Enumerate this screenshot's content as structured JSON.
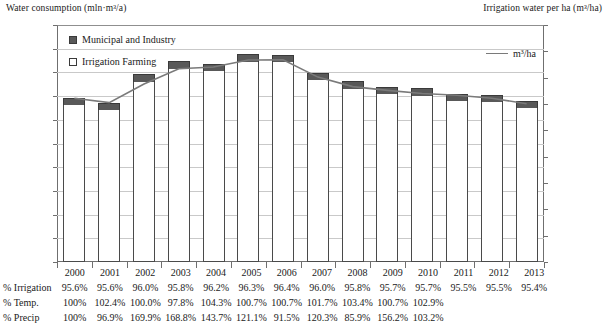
{
  "chart_data": {
    "type": "bar",
    "title": "",
    "subtitle": "",
    "left_axis_title": "Water consumption (mln·m³/a)",
    "right_axis_title": "Irrigation water per ha (m³/ha)",
    "xlabel": "",
    "grid": true,
    "legend_position": "top-left and top-right",
    "categories": [
      "2000",
      "2001",
      "2002",
      "2003",
      "2004",
      "2005",
      "2006",
      "2007",
      "2008",
      "2009",
      "2010",
      "2011",
      "2012",
      "2013"
    ],
    "ylim": [
      0,
      5000
    ],
    "y2lim": [
      0,
      18000
    ],
    "yticks": [
      "0",
      "500",
      "1000",
      "1500",
      "2000",
      "2500",
      "3000",
      "3500",
      "4000",
      "4500",
      "5000"
    ],
    "y2ticks": [
      "0",
      "2000",
      "4000",
      "6000",
      "8000",
      "10000",
      "12000",
      "14000",
      "16000",
      "18000"
    ],
    "series": [
      {
        "name": "Irrigation Farming",
        "axis": "left",
        "type": "bar-segment",
        "color": "#ffffff",
        "values": [
          3310,
          3210,
          3800,
          4065,
          4020,
          4220,
          4220,
          3835,
          3655,
          3540,
          3505,
          3395,
          3370,
          3245
        ]
      },
      {
        "name": "Municipal and Industry",
        "axis": "left",
        "type": "bar-segment",
        "color": "#595959",
        "values": [
          152,
          151,
          158,
          178,
          158,
          161,
          157,
          160,
          160,
          159,
          158,
          159,
          158,
          154
        ]
      },
      {
        "name": "m³/ha",
        "axis": "right",
        "type": "line",
        "color": "#7a7a7a",
        "values": [
          12430,
          12110,
          13520,
          14680,
          14810,
          15340,
          15350,
          14040,
          13320,
          13030,
          12800,
          12660,
          12430,
          12020
        ]
      }
    ],
    "table": {
      "header": [
        "2000",
        "2001",
        "2002",
        "2003",
        "2004",
        "2005",
        "2006",
        "2007",
        "2008",
        "2009",
        "2010",
        "2011",
        "2012",
        "2013"
      ],
      "rows": [
        {
          "label": "% Irrigation",
          "values": [
            "95.6%",
            "95.6%",
            "96.0%",
            "95.8%",
            "96.2%",
            "96.3%",
            "96.4%",
            "96.0%",
            "95.8%",
            "95.7%",
            "95.7%",
            "95.5%",
            "95.5%",
            "95.4%"
          ]
        },
        {
          "label": "% Temp.",
          "values": [
            "100%",
            "102.4%",
            "100.0%",
            "97.8%",
            "104.3%",
            "100.7%",
            "100.7%",
            "101.7%",
            "103.4%",
            "100.7%",
            "102.9%",
            "",
            "",
            ""
          ]
        },
        {
          "label": "% Precip",
          "values": [
            "100%",
            "96.9%",
            "169.9%",
            "168.8%",
            "143.7%",
            "121.1%",
            "91.5%",
            "120.3%",
            "85.9%",
            "156.2%",
            "103.2%",
            "",
            "",
            ""
          ]
        }
      ]
    }
  },
  "legend": {
    "municipal_label": "Municipal and Industry",
    "irrigation_label": "Irrigation Farming",
    "line_label": "m³/ha"
  }
}
